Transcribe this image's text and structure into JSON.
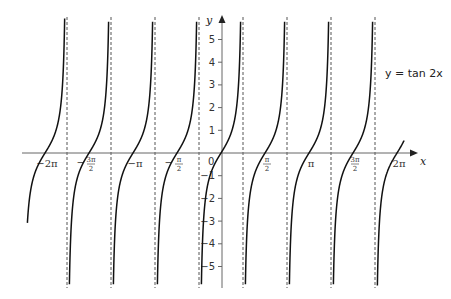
{
  "chart_data": {
    "type": "line",
    "title": "",
    "function": "y = tan 2x",
    "legend_label": "y = tan 2x",
    "xlabel": "x",
    "ylabel": "y",
    "xlim": [
      -2.2,
      2.1
    ],
    "ylim": [
      -6,
      6
    ],
    "x_unit": "pi",
    "x_ticks": [
      {
        "value": -2.0,
        "label": "-2π"
      },
      {
        "value": -1.5,
        "label": "-3π/2"
      },
      {
        "value": -1.0,
        "label": "-π"
      },
      {
        "value": -0.5,
        "label": "-π/2"
      },
      {
        "value": 0.0,
        "label": "0"
      },
      {
        "value": 0.5,
        "label": "π/2"
      },
      {
        "value": 1.0,
        "label": "π"
      },
      {
        "value": 1.5,
        "label": "3π/2"
      },
      {
        "value": 2.0,
        "label": "2π"
      }
    ],
    "y_ticks": [
      5,
      4,
      3,
      2,
      1,
      -1,
      -2,
      -3,
      -4,
      -5
    ],
    "asymptotes_x_in_pi": [
      -1.75,
      -1.25,
      -0.75,
      -0.25,
      0.25,
      0.75,
      1.25,
      1.75
    ],
    "asymptote_style": "dashed",
    "grid": false,
    "legend_position": "right"
  },
  "labels": {
    "x_axis": "x",
    "y_axis": "y",
    "origin": "0",
    "equation": "y = tan 2x"
  },
  "colors": {
    "curve": "#111111",
    "axis": "#666666",
    "asymptote": "#555555",
    "text": "#333333"
  }
}
